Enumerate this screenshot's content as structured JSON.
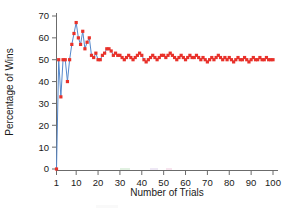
{
  "chart_data": {
    "type": "line",
    "title": "",
    "xlabel": "Number of Trials",
    "ylabel": "Percentage of Wins",
    "xlim": [
      1,
      100
    ],
    "ylim": [
      0,
      70
    ],
    "xticks": [
      1,
      10,
      20,
      30,
      40,
      50,
      60,
      70,
      80,
      90,
      100
    ],
    "xtick_labels": [
      "1",
      "10",
      "20",
      "30",
      "40",
      "50",
      "60",
      "70",
      "80",
      "90",
      "100"
    ],
    "yticks": [
      0,
      10,
      20,
      30,
      40,
      50,
      60,
      70
    ],
    "ytick_labels": [
      "0",
      "10",
      "20",
      "30",
      "40",
      "50",
      "60",
      "70"
    ],
    "grid": false,
    "legend": null,
    "line_color": "#5588cc",
    "marker_color": "#e8312a",
    "marker": "square",
    "series": [
      {
        "name": "Percentage of Wins",
        "x": [
          1,
          2,
          3,
          4,
          5,
          6,
          7,
          8,
          9,
          10,
          11,
          12,
          13,
          14,
          15,
          16,
          17,
          18,
          19,
          20,
          21,
          22,
          23,
          24,
          25,
          26,
          27,
          28,
          29,
          30,
          31,
          32,
          33,
          34,
          35,
          36,
          37,
          38,
          39,
          40,
          41,
          42,
          43,
          44,
          45,
          46,
          47,
          48,
          49,
          50,
          51,
          52,
          53,
          54,
          55,
          56,
          57,
          58,
          59,
          60,
          61,
          62,
          63,
          64,
          65,
          66,
          67,
          68,
          69,
          70,
          71,
          72,
          73,
          74,
          75,
          76,
          77,
          78,
          79,
          80,
          81,
          82,
          83,
          84,
          85,
          86,
          87,
          88,
          89,
          90,
          91,
          92,
          93,
          94,
          95,
          96,
          97,
          98,
          99,
          100
        ],
        "values": [
          0,
          50,
          33,
          50,
          50,
          40,
          50,
          57,
          62,
          67,
          60,
          57,
          63,
          55,
          58,
          60,
          52,
          51,
          53,
          50,
          50,
          52,
          53,
          55,
          55,
          54,
          52,
          53,
          52,
          52,
          51,
          50,
          51,
          52,
          51,
          50,
          51,
          52,
          53,
          52,
          50,
          49,
          50,
          51,
          52,
          51,
          50,
          51,
          52,
          52,
          51,
          52,
          53,
          52,
          51,
          50,
          51,
          52,
          51,
          50,
          51,
          52,
          51,
          51,
          52,
          51,
          50,
          51,
          50,
          49,
          50,
          51,
          50,
          51,
          52,
          51,
          50,
          51,
          50,
          51,
          50,
          49,
          50,
          51,
          50,
          50,
          51,
          50,
          49,
          50,
          51,
          50,
          50,
          51,
          50,
          50,
          51,
          50,
          50,
          50
        ]
      }
    ]
  },
  "axis": {
    "xlabel": "Number of Trials",
    "ylabel": "Percentage of Wins"
  }
}
